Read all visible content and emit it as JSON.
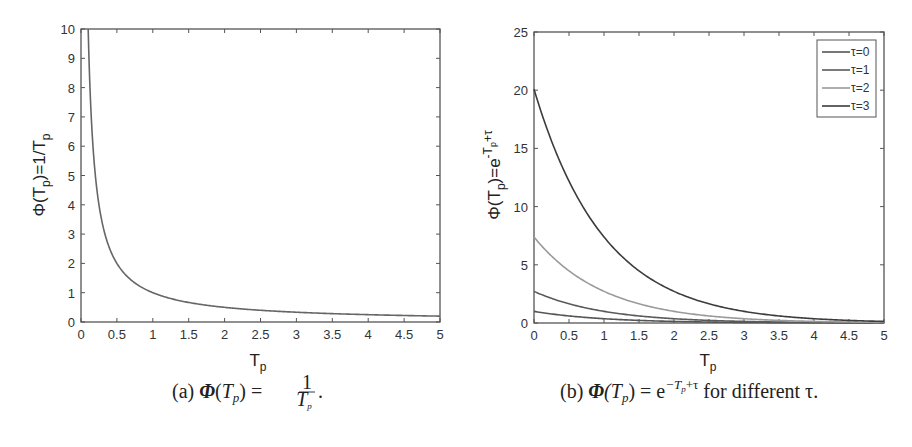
{
  "chart_data": [
    {
      "id": "a",
      "type": "line",
      "title": "",
      "caption": "(a) Φ(T_p) = 1/T_p.",
      "caption_parts": {
        "prefix": "(a) ",
        "phi": "Φ",
        "lhs_open": "(",
        "T": "T",
        "p": "p",
        "lhs_close": ")",
        "eq": " = ",
        "num": "1",
        "den_T": "T",
        "den_p": "p",
        "end": "."
      },
      "xlabel": "T_p",
      "xlabel_parts": {
        "main": "T",
        "sub": "p"
      },
      "ylabel": "Φ(T_p)=1/T_p",
      "ylabel_parts": {
        "a": "Φ(T",
        "sub1": "p",
        "b": ")=1/T",
        "sub2": "p"
      },
      "xlim": [
        0,
        5
      ],
      "ylim": [
        0,
        10
      ],
      "xticks": [
        "0",
        "0.5",
        "1",
        "1.5",
        "2",
        "2.5",
        "3",
        "3.5",
        "4",
        "4.5",
        "5"
      ],
      "yticks": [
        "0",
        "1",
        "2",
        "3",
        "4",
        "5",
        "6",
        "7",
        "8",
        "9",
        "10"
      ],
      "grid": false,
      "legend": null,
      "series": [
        {
          "name": "1/T_p",
          "function": "1/x",
          "color": "#666666",
          "x": [
            0.1,
            0.2,
            0.3,
            0.5,
            0.75,
            1,
            1.5,
            2,
            2.5,
            3,
            3.5,
            4,
            4.5,
            5
          ],
          "y": [
            10,
            5,
            3.33,
            2,
            1.33,
            1,
            0.67,
            0.5,
            0.4,
            0.33,
            0.29,
            0.25,
            0.22,
            0.2
          ]
        }
      ]
    },
    {
      "id": "b",
      "type": "line",
      "title": "",
      "caption": "(b) Φ(T_p) = e^(−T_p+τ) for different τ.",
      "caption_parts": {
        "prefix": "(b) ",
        "phi": "Φ",
        "lhs": "(T",
        "p": "p",
        "rhs": ") = e",
        "exp": "−T",
        "exp_p": "p",
        "exp_tail": "+τ",
        "suffix": " for different τ."
      },
      "xlabel": "T_p",
      "xlabel_parts": {
        "main": "T",
        "sub": "p"
      },
      "ylabel": "Φ(T_p)=e^(-T_p+τ)",
      "ylabel_parts": {
        "a": "Φ(T",
        "sub1": "p",
        "b": ")=e",
        "sup": "-T",
        "sup_sub": "p",
        "sup_tail": "+τ"
      },
      "xlim": [
        0,
        5
      ],
      "ylim": [
        0,
        25
      ],
      "xticks": [
        "0",
        "0.5",
        "1",
        "1.5",
        "2",
        "2.5",
        "3",
        "3.5",
        "4",
        "4.5",
        "5"
      ],
      "yticks": [
        "0",
        "5",
        "10",
        "15",
        "20",
        "25"
      ],
      "grid": false,
      "legend": {
        "position": "upper right",
        "entries": [
          "τ=0",
          "τ=1",
          "τ=2",
          "τ=3"
        ]
      },
      "series": [
        {
          "name": "τ=0",
          "tau": 0,
          "color": "#555555",
          "x": [
            0,
            0.5,
            1,
            1.5,
            2,
            2.5,
            3,
            3.5,
            4,
            4.5,
            5
          ],
          "y": [
            1,
            0.61,
            0.37,
            0.22,
            0.14,
            0.08,
            0.05,
            0.03,
            0.02,
            0.01,
            0.01
          ]
        },
        {
          "name": "τ=1",
          "tau": 1,
          "color": "#5a5a5a",
          "x": [
            0,
            0.5,
            1,
            1.5,
            2,
            2.5,
            3,
            3.5,
            4,
            4.5,
            5
          ],
          "y": [
            2.72,
            1.65,
            1,
            0.61,
            0.37,
            0.22,
            0.14,
            0.08,
            0.05,
            0.03,
            0.02
          ]
        },
        {
          "name": "τ=2",
          "tau": 2,
          "color": "#9a9a9a",
          "x": [
            0,
            0.5,
            1,
            1.5,
            2,
            2.5,
            3,
            3.5,
            4,
            4.5,
            5
          ],
          "y": [
            7.39,
            4.48,
            2.72,
            1.65,
            1,
            0.61,
            0.37,
            0.22,
            0.14,
            0.08,
            0.05
          ]
        },
        {
          "name": "τ=3",
          "tau": 3,
          "color": "#3c3c3c",
          "x": [
            0,
            0.5,
            1,
            1.5,
            2,
            2.5,
            3,
            3.5,
            4,
            4.5,
            5
          ],
          "y": [
            20.09,
            12.18,
            7.39,
            4.48,
            2.72,
            1.65,
            1,
            0.61,
            0.37,
            0.22,
            0.14
          ]
        }
      ]
    }
  ]
}
